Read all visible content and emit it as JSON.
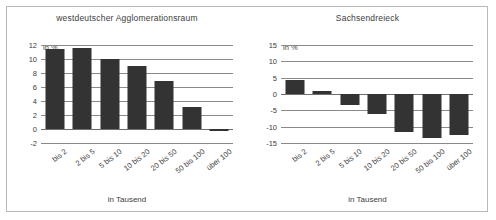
{
  "figure": {
    "border_color": "#b9b9b9",
    "bar_color": "#333333",
    "grid_color": "#8a8a8a"
  },
  "charts": [
    {
      "id": "westdeutscher-agglomerationsraum",
      "title": "westdeutscher Agglomerationsraum",
      "unit_label": "in %",
      "xlabel": "in Tausend",
      "yticks": [
        "12",
        "10",
        "8",
        "6",
        "4",
        "2",
        "0",
        "-2"
      ],
      "categories": [
        "bis 2",
        "2 bis 5",
        "5 bis 10",
        "10 bis 20",
        "20 bis 50",
        "50 bis 100",
        "über 100"
      ],
      "values": [
        11.5,
        11.6,
        10.0,
        9.0,
        6.9,
        3.2,
        -0.2
      ]
    },
    {
      "id": "sachsendreieck",
      "title": "Sachsendreieck",
      "unit_label": "in %",
      "xlabel": "in Tausend",
      "yticks": [
        "15",
        "10",
        "5",
        "0",
        "-5",
        "-10",
        "-15"
      ],
      "categories": [
        "bis 2",
        "2 bis 5",
        "5 bis 10",
        "10 bis 20",
        "20 bis 50",
        "50 bis 100",
        "über 100"
      ],
      "values": [
        4.3,
        0.8,
        -3.5,
        -6.0,
        -11.7,
        -13.5,
        -12.7
      ]
    }
  ],
  "chart_data": [
    {
      "type": "bar",
      "title": "westdeutscher Agglomerationsraum",
      "categories": [
        "bis 2",
        "2 bis 5",
        "5 bis 10",
        "10 bis 20",
        "20 bis 50",
        "50 bis 100",
        "über 100"
      ],
      "values": [
        11.5,
        11.6,
        10.0,
        9.0,
        6.9,
        3.2,
        -0.2
      ],
      "xlabel": "in Tausend",
      "ylabel": "in %",
      "ylim": [
        -2,
        12
      ],
      "ytick_step": 2,
      "yticks": [
        12,
        10,
        8,
        6,
        4,
        2,
        0,
        -2
      ],
      "grid": true,
      "legend": "none",
      "bar_color": "#333333"
    },
    {
      "type": "bar",
      "title": "Sachsendreieck",
      "categories": [
        "bis 2",
        "2 bis 5",
        "5 bis 10",
        "10 bis 20",
        "20 bis 50",
        "50 bis 100",
        "über 100"
      ],
      "values": [
        4.3,
        0.8,
        -3.5,
        -6.0,
        -11.7,
        -13.5,
        -12.7
      ],
      "xlabel": "in Tausend",
      "ylabel": "in %",
      "ylim": [
        -15,
        15
      ],
      "ytick_step": 5,
      "yticks": [
        15,
        10,
        5,
        0,
        -5,
        -10,
        -15
      ],
      "grid": true,
      "legend": "none",
      "bar_color": "#333333"
    }
  ]
}
